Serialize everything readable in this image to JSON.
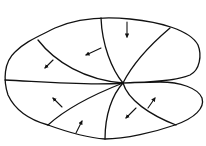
{
  "diagram": {
    "title": "",
    "stroke_color": "#111111",
    "background_color": "#ffffff",
    "center": [
      123,
      83
    ],
    "segments": 8,
    "arrows": [
      {
        "id": "arrow-top",
        "direction": "down"
      },
      {
        "id": "arrow-upper-left-inner",
        "direction": "left"
      },
      {
        "id": "arrow-upper-left-outer",
        "direction": "down-left"
      },
      {
        "id": "arrow-lower-left",
        "direction": "up-left"
      },
      {
        "id": "arrow-bottom-left",
        "direction": "up-right"
      },
      {
        "id": "arrow-bottom-right-inner",
        "direction": "down-left"
      },
      {
        "id": "arrow-bottom-right-outer",
        "direction": "up-right"
      }
    ]
  }
}
